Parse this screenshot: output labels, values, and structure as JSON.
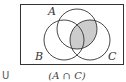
{
  "diagram": {
    "type": "venn",
    "universe_label": "U",
    "caption": "(A ∩ C)",
    "sets": [
      {
        "name": "A",
        "cx": 77,
        "cy": 29,
        "r": 20
      },
      {
        "name": "B",
        "cx": 64,
        "cy": 40,
        "r": 20
      },
      {
        "name": "C",
        "cx": 90,
        "cy": 40,
        "r": 20
      }
    ],
    "shaded_region": "A ∩ C",
    "colors": {
      "stroke": "#333333",
      "shade": "#cccccc",
      "background": "#ffffff"
    }
  }
}
